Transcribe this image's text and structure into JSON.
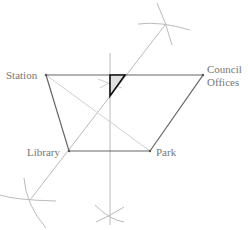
{
  "diagram": {
    "labels": {
      "station": "Station",
      "council_line1": "Council",
      "council_line2": "Offices",
      "library": "Library",
      "park": "Park"
    },
    "points": {
      "station": [
        46,
        75
      ],
      "council_offices": [
        203,
        75
      ],
      "library": [
        69,
        151
      ],
      "park": [
        150,
        151
      ]
    },
    "colors": {
      "quadrilateral": "#666666",
      "construction": "#bbbbbb",
      "diagonal": "#cccccc",
      "triangle": "#111111",
      "label": "#777777"
    }
  }
}
